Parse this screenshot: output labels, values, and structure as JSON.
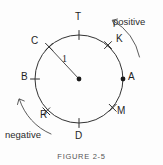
{
  "figure": {
    "caption": "FIGURE  2-5",
    "radius_label": "1",
    "colors": {
      "circle_stroke": "#333333",
      "tick_stroke": "#2f2f2f",
      "label_text": "#1f1f1f",
      "arrow_stroke": "#4a4a4a",
      "caption_text": "#555555",
      "background": "#fdfdfd"
    },
    "geometry": {
      "center_x": 79,
      "center_y": 79,
      "radius": 44
    },
    "points": [
      {
        "label": "T",
        "angle_deg": 90,
        "marker": "tick",
        "label_x": 75,
        "label_y": 12
      },
      {
        "label": "K",
        "angle_deg": 50,
        "marker": "cross",
        "label_x": 116,
        "label_y": 34
      },
      {
        "label": "A",
        "angle_deg": 0,
        "marker": "dot",
        "label_x": 128,
        "label_y": 72
      },
      {
        "label": "M",
        "angle_deg": -40,
        "marker": "cross",
        "label_x": 117,
        "label_y": 106
      },
      {
        "label": "D",
        "angle_deg": -90,
        "marker": "tick",
        "label_x": 75,
        "label_y": 131
      },
      {
        "label": "R",
        "angle_deg": -130,
        "marker": "cross",
        "label_x": 40,
        "label_y": 110
      },
      {
        "label": "B",
        "angle_deg": 180,
        "marker": "tick",
        "label_x": 21,
        "label_y": 72
      },
      {
        "label": "C",
        "angle_deg": 133,
        "marker": "cross",
        "label_x": 31,
        "label_y": 36
      }
    ],
    "directions": [
      {
        "name": "positive",
        "label": "positive",
        "sense": "counterclockwise",
        "label_x": 113,
        "label_y": 17
      },
      {
        "name": "negative",
        "label": "negative",
        "sense": "clockwise",
        "label_x": 5,
        "label_y": 130
      }
    ]
  }
}
